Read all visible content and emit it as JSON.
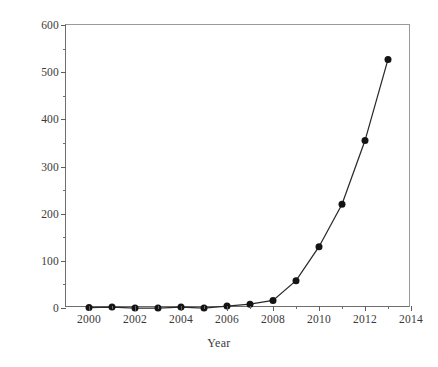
{
  "chart_data": {
    "type": "line",
    "title": "",
    "xlabel": "Year",
    "ylabel": "Number of publications",
    "x": [
      2000,
      2001,
      2002,
      2003,
      2004,
      2005,
      2006,
      2007,
      2008,
      2009,
      2010,
      2011,
      2012,
      2013
    ],
    "values": [
      1,
      2,
      0,
      0,
      2,
      0,
      4,
      8,
      16,
      58,
      130,
      220,
      355,
      527
    ],
    "series": [
      {
        "name": "Number of publications",
        "values": [
          1,
          2,
          0,
          0,
          2,
          0,
          4,
          8,
          16,
          58,
          130,
          220,
          355,
          527
        ]
      }
    ],
    "xlim": [
      1999,
      2014
    ],
    "ylim": [
      0,
      600
    ],
    "x_ticks_major": [
      2000,
      2002,
      2004,
      2006,
      2008,
      2010,
      2012,
      2014
    ],
    "x_tick_labels": [
      "2000",
      "2002",
      "2004",
      "2006",
      "2008",
      "2010",
      "2012",
      "2014"
    ],
    "x_ticks_minor": [
      2001,
      2003,
      2005,
      2007,
      2009,
      2011,
      2013
    ],
    "y_ticks_major": [
      0,
      100,
      200,
      300,
      400,
      500,
      600
    ],
    "y_tick_labels": [
      "0",
      "100",
      "200",
      "300",
      "400",
      "500",
      "600"
    ],
    "y_ticks_minor": [
      50,
      150,
      250,
      350,
      450,
      550
    ],
    "grid": false,
    "legend": false,
    "marker": "filled-circle",
    "marker_color": "#141414",
    "line_color": "#2a2a2a",
    "background_color": "#ffffff",
    "axis_color": "#5e5e5e"
  }
}
